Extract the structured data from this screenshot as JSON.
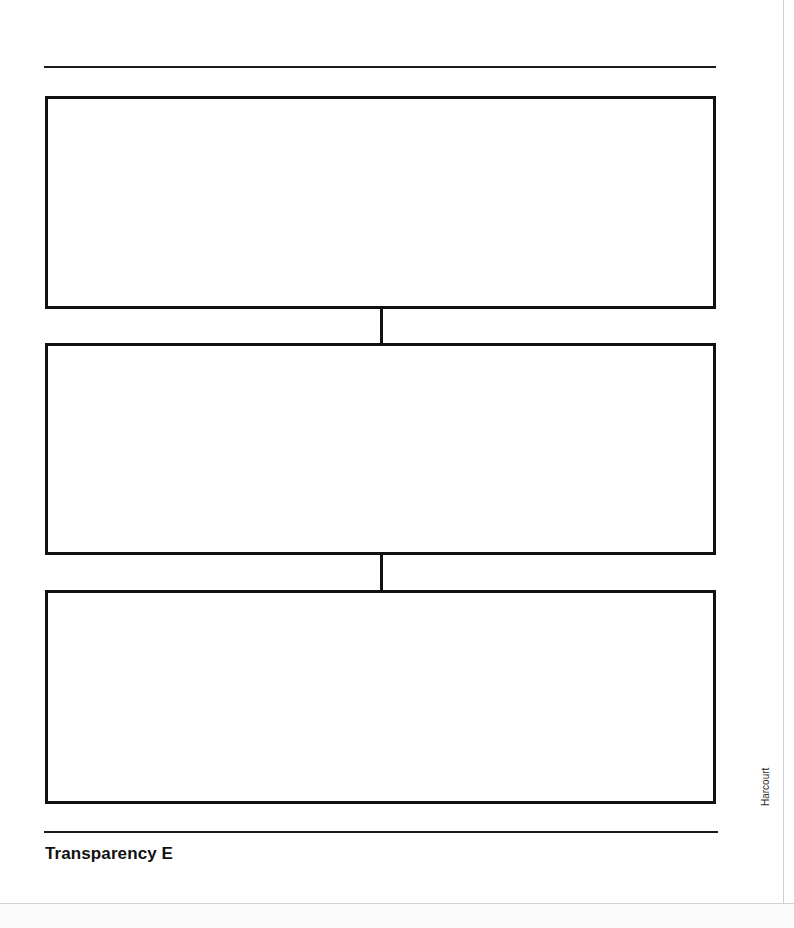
{
  "document": {
    "title": "Transparency E",
    "type": "graphic-organizer-worksheet",
    "organizer_kind": "sequence-flow-chart",
    "publisher_credit": "Harcourt",
    "page_background": "#ffffff",
    "ink_color": "#111111"
  },
  "rules": {
    "top": "",
    "bottom": ""
  },
  "organizer": {
    "boxes": [
      {
        "id": "box-1",
        "text": "",
        "placeholder": ""
      },
      {
        "id": "box-2",
        "text": "",
        "placeholder": ""
      },
      {
        "id": "box-3",
        "text": "",
        "placeholder": ""
      }
    ],
    "connectors": [
      {
        "id": "connector-1",
        "from": "box-1",
        "to": "box-2"
      },
      {
        "id": "connector-2",
        "from": "box-2",
        "to": "box-3"
      }
    ]
  },
  "caption": {
    "label": "Transparency E"
  },
  "credit": {
    "label": "Harcourt"
  }
}
